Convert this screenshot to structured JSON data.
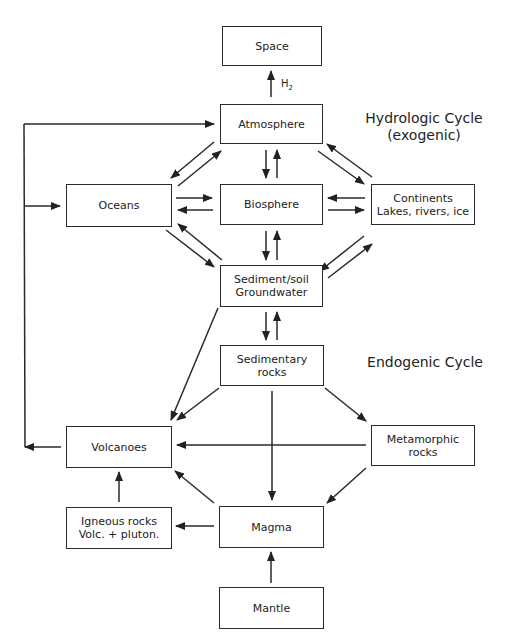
{
  "diagram": {
    "title_hydrologic": "Hydrologic Cycle",
    "title_hydrologic_sub": "(exogenic)",
    "title_endogenic": "Endogenic Cycle",
    "h2_label": "H",
    "h2_subscript": "2",
    "nodes": {
      "space": {
        "line1": "Space"
      },
      "atmosphere": {
        "line1": "Atmosphere"
      },
      "oceans": {
        "line1": "Oceans"
      },
      "biosphere": {
        "line1": "Biosphere"
      },
      "continents": {
        "line1": "Continents",
        "line2": "Lakes, rivers, ice"
      },
      "sediment": {
        "line1": "Sediment/soil",
        "line2": "Groundwater"
      },
      "sedimentary": {
        "line1": "Sedimentary",
        "line2": "rocks"
      },
      "volcanoes": {
        "line1": "Volcanoes"
      },
      "metamorphic": {
        "line1": "Metamorphic",
        "line2": "rocks"
      },
      "igneous": {
        "line1": "Igneous rocks",
        "line2": "Volc. + pluton."
      },
      "magma": {
        "line1": "Magma"
      },
      "mantle": {
        "line1": "Mantle"
      }
    },
    "edges": [
      {
        "from": "atmosphere",
        "to": "space",
        "label": "H2"
      },
      {
        "from": "atmosphere",
        "to": "biosphere"
      },
      {
        "from": "biosphere",
        "to": "atmosphere"
      },
      {
        "from": "atmosphere",
        "to": "oceans"
      },
      {
        "from": "oceans",
        "to": "atmosphere"
      },
      {
        "from": "atmosphere",
        "to": "continents"
      },
      {
        "from": "continents",
        "to": "atmosphere"
      },
      {
        "from": "oceans",
        "to": "biosphere"
      },
      {
        "from": "biosphere",
        "to": "oceans"
      },
      {
        "from": "continents",
        "to": "biosphere"
      },
      {
        "from": "biosphere",
        "to": "continents"
      },
      {
        "from": "oceans",
        "to": "sediment"
      },
      {
        "from": "sediment",
        "to": "oceans"
      },
      {
        "from": "continents",
        "to": "sediment"
      },
      {
        "from": "sediment",
        "to": "continents"
      },
      {
        "from": "biosphere",
        "to": "sediment"
      },
      {
        "from": "sediment",
        "to": "biosphere"
      },
      {
        "from": "sediment",
        "to": "sedimentary"
      },
      {
        "from": "sedimentary",
        "to": "sediment"
      },
      {
        "from": "sediment",
        "to": "volcanoes"
      },
      {
        "from": "sedimentary",
        "to": "volcanoes"
      },
      {
        "from": "sedimentary",
        "to": "metamorphic"
      },
      {
        "from": "sedimentary",
        "to": "magma"
      },
      {
        "from": "metamorphic",
        "to": "volcanoes"
      },
      {
        "from": "metamorphic",
        "to": "magma"
      },
      {
        "from": "magma",
        "to": "volcanoes"
      },
      {
        "from": "magma",
        "to": "igneous"
      },
      {
        "from": "igneous",
        "to": "volcanoes"
      },
      {
        "from": "mantle",
        "to": "magma"
      },
      {
        "from": "volcanoes",
        "to": "atmosphere"
      },
      {
        "from": "volcanoes",
        "to": "oceans"
      }
    ]
  }
}
